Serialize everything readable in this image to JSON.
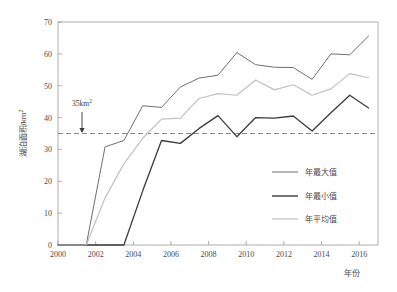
{
  "chart_data": {
    "type": "line",
    "title": "",
    "xlabel": "年份",
    "ylabel": "湖泊面积/km²",
    "xlim": [
      2000,
      2017
    ],
    "ylim": [
      0,
      70
    ],
    "xticks": [
      2000,
      2002,
      2004,
      2006,
      2008,
      2010,
      2012,
      2014,
      2016
    ],
    "yticks": [
      0,
      10,
      20,
      30,
      40,
      50,
      60,
      70
    ],
    "grid": false,
    "legend_position": "bottom-right",
    "reference_line": {
      "value": 35,
      "label": "35km²",
      "style": "dashed",
      "color": "#8a8a8a"
    },
    "series": [
      {
        "name": "年最大值",
        "color": "#6e6e6e",
        "width": 1.0,
        "x": [
          2000.0,
          2001.5,
          2002.5,
          2003.5,
          2004.5,
          2005.5,
          2006.5,
          2007.5,
          2008.5,
          2009.5,
          2010.5,
          2011.5,
          2012.5,
          2013.5,
          2014.5,
          2015.5,
          2016.5
        ],
        "y": [
          0,
          0,
          30.8,
          32.8,
          43.7,
          43.2,
          49.6,
          52.4,
          53.3,
          60.4,
          56.6,
          55.8,
          55.7,
          52.0,
          60.0,
          59.7,
          65.6
        ]
      },
      {
        "name": "年最小值",
        "color": "#3a3a3a",
        "width": 1.3,
        "x": [
          2000.0,
          2001.5,
          2002.5,
          2003.5,
          2004.5,
          2005.5,
          2006.5,
          2007.5,
          2008.5,
          2009.5,
          2010.5,
          2011.5,
          2012.5,
          2013.5,
          2014.5,
          2015.5,
          2016.5
        ],
        "y": [
          0,
          0,
          0,
          0,
          17.0,
          32.8,
          31.9,
          36.6,
          40.6,
          34.0,
          40.0,
          39.8,
          40.5,
          35.8,
          41.5,
          47.0,
          43.0
        ]
      },
      {
        "name": "年平均值",
        "color": "#c0c0c0",
        "width": 1.2,
        "x": [
          2000.0,
          2001.5,
          2002.5,
          2003.5,
          2004.5,
          2005.5,
          2006.5,
          2007.5,
          2008.5,
          2009.5,
          2010.5,
          2011.5,
          2012.5,
          2013.5,
          2014.5,
          2015.5,
          2016.5
        ],
        "y": [
          0,
          0,
          14.8,
          25.5,
          33.5,
          39.5,
          39.8,
          46.0,
          47.5,
          47.0,
          51.8,
          48.7,
          50.3,
          47.0,
          49.0,
          53.8,
          52.5
        ]
      }
    ]
  },
  "axis": {
    "y_title": "湖泊面积/km",
    "y_title_sup": "2",
    "x_title": "年份",
    "xtick_labels": [
      "2000",
      "2002",
      "2004",
      "2006",
      "2008",
      "2010",
      "2012",
      "2014",
      "2016"
    ],
    "ytick_labels": [
      "0",
      "10",
      "20",
      "30",
      "40",
      "50",
      "60",
      "70"
    ]
  },
  "annotation": {
    "text": "35km",
    "sup": "2"
  },
  "legend": {
    "items": [
      {
        "label": "年最大值",
        "color": "#6e6e6e",
        "width": 1.0
      },
      {
        "label": "年最小值",
        "color": "#3a3a3a",
        "width": 1.4
      },
      {
        "label": "年平均值",
        "color": "#c0c0c0",
        "width": 1.2
      }
    ]
  }
}
